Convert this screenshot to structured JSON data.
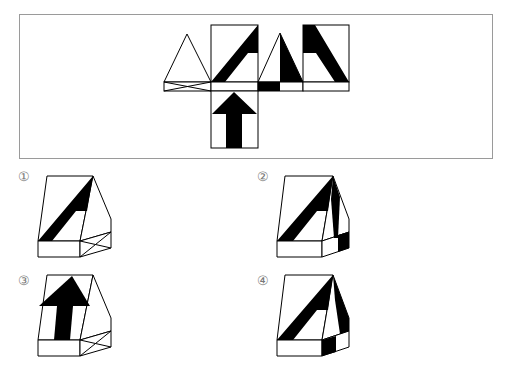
{
  "question": {
    "net_panel": {
      "description": "Unfolded net of a triangular prism with black pattern",
      "faces": [
        "left-triangle",
        "front-square",
        "right-triangle",
        "back-square",
        "bottom-square-arrow",
        "side-strips"
      ]
    },
    "options": [
      {
        "number": "1",
        "label": "①",
        "description": "prism with diagonal band on front face, crossed lines on side strip"
      },
      {
        "number": "2",
        "label": "②",
        "description": "prism with diagonal band on front face, black stripe on side face"
      },
      {
        "number": "3",
        "label": "③",
        "description": "prism with upward arrow on front face, crossed lines on side strip"
      },
      {
        "number": "4",
        "label": "④",
        "description": "prism with diagonal band on front face, black band on side face and strip"
      }
    ]
  },
  "colors": {
    "ink": "#000000",
    "frame": "#9a9a9a",
    "label": "#777777",
    "background": "#ffffff"
  }
}
